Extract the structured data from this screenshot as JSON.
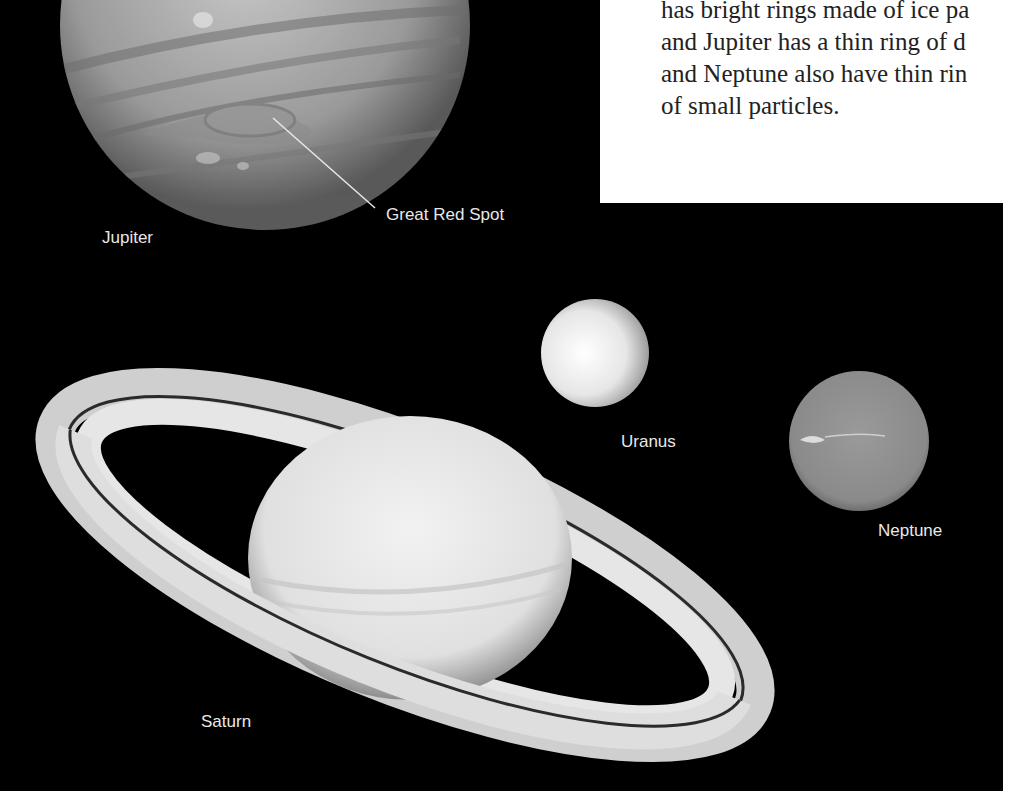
{
  "figure": {
    "caption_text_lines": [
      "has bright rings made of ice pa",
      "and Jupiter has a thin ring of d",
      "and Neptune also have thin rin",
      "of small particles."
    ],
    "labels": {
      "jupiter": "Jupiter",
      "great_red_spot": "Great Red Spot",
      "uranus": "Uranus",
      "neptune": "Neptune",
      "saturn": "Saturn"
    },
    "colors": {
      "background": "#000000",
      "page": "#ffffff",
      "text": "#222222",
      "label": "#e8e8e8"
    }
  }
}
